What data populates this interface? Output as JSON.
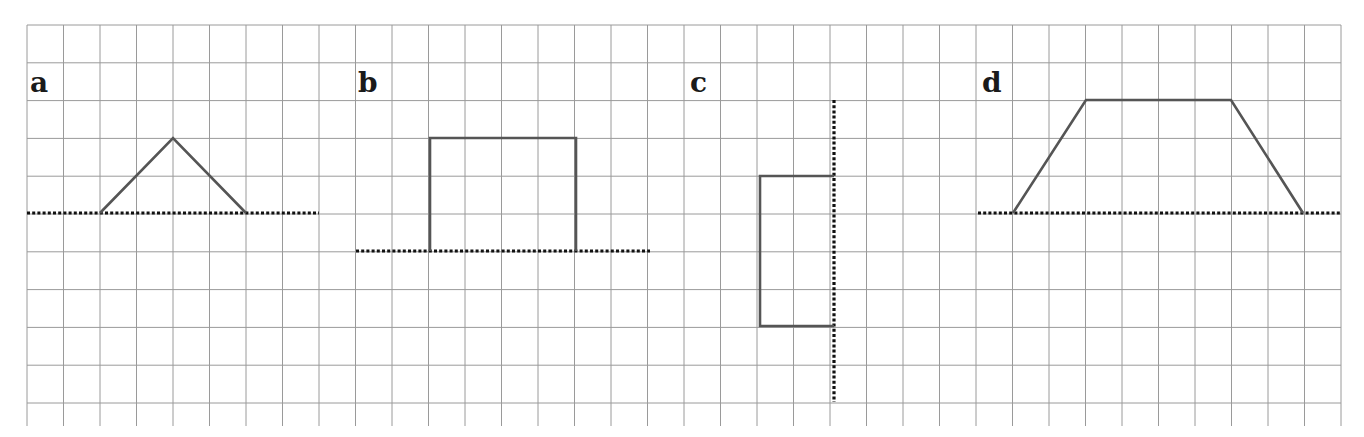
{
  "figure": {
    "grid": {
      "x0": 27,
      "y0": 25,
      "cols": 36,
      "rows": 11,
      "cell_w": 36.5,
      "cell_h": 37.8,
      "bottom": 426,
      "color": "#9a9a9a"
    },
    "colors": {
      "shape_stroke": "#555555",
      "axis_dotted": "#111111",
      "background": "#ffffff"
    },
    "panels": [
      {
        "id": "a",
        "label": "a",
        "label_pos": [
          30,
          92
        ],
        "axis": {
          "orientation": "horizontal",
          "from": [
            27,
            213
          ],
          "to": [
            319,
            213
          ]
        },
        "shape": {
          "type": "triangle",
          "points": [
            [
              100,
              213
            ],
            [
              173,
              138
            ],
            [
              246,
              213
            ]
          ]
        }
      },
      {
        "id": "b",
        "label": "b",
        "label_pos": [
          358,
          92
        ],
        "axis": {
          "orientation": "horizontal",
          "from": [
            356,
            251
          ],
          "to": [
            650,
            251
          ]
        },
        "shape": {
          "type": "rectangle",
          "points": [
            [
              430,
              251
            ],
            [
              430,
              138
            ],
            [
              576,
              138
            ],
            [
              576,
              251
            ]
          ]
        }
      },
      {
        "id": "c",
        "label": "c",
        "label_pos": [
          690,
          92
        ],
        "axis": {
          "orientation": "vertical",
          "from": [
            834,
            100
          ],
          "to": [
            834,
            402
          ]
        },
        "shape": {
          "type": "rectangle",
          "points": [
            [
              834,
              176
            ],
            [
              760,
              176
            ],
            [
              760,
              326
            ],
            [
              834,
              326
            ]
          ]
        }
      },
      {
        "id": "d",
        "label": "d",
        "label_pos": [
          982,
          92
        ],
        "axis": {
          "orientation": "horizontal",
          "from": [
            978,
            213
          ],
          "to": [
            1341,
            213
          ]
        },
        "shape": {
          "type": "trapezoid",
          "points": [
            [
              1013,
              213
            ],
            [
              1086,
              100
            ],
            [
              1231,
              100
            ],
            [
              1303,
              213
            ]
          ]
        }
      }
    ]
  }
}
